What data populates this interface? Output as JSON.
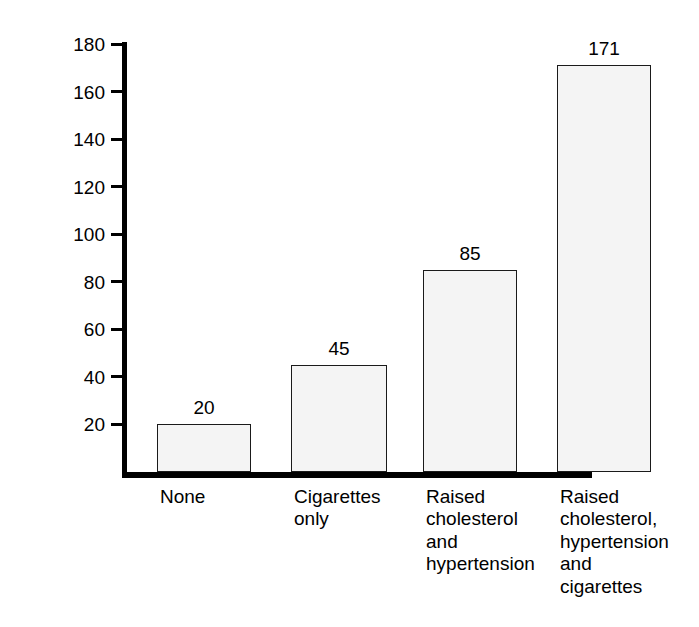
{
  "chart_data": {
    "type": "bar",
    "title": "",
    "subtitle": "",
    "xlabel": "",
    "ylabel": "Rates per 1000",
    "categories": [
      "None",
      "Cigarettes\nonly",
      "Raised\ncholesterol\nand\nhypertension",
      "Raised\ncholesterol,\nhypertension\nand\ncigarettes"
    ],
    "values": [
      20,
      45,
      85,
      171
    ],
    "value_labels": [
      "20",
      "45",
      "85",
      "171"
    ],
    "ylim": [
      0,
      190
    ],
    "yticks": [
      20,
      40,
      60,
      80,
      100,
      120,
      140,
      160,
      180
    ],
    "ytick_labels": [
      "20",
      "40",
      "60",
      "80",
      "100",
      "120",
      "140",
      "160",
      "180"
    ],
    "grid": false,
    "legend": null,
    "colors": {
      "bar_fill": "#f4f4f4",
      "bar_stroke": "#1a1a1a",
      "axis": "#000000",
      "text": "#000000",
      "background": "#ffffff"
    }
  }
}
